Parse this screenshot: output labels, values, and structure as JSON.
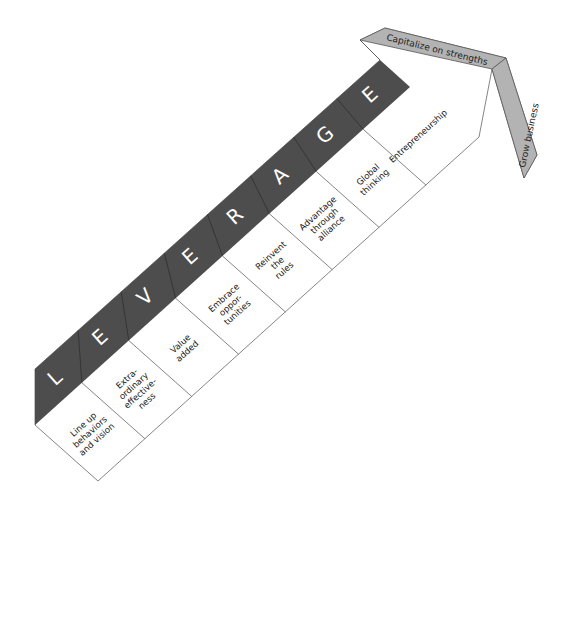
{
  "diagram": {
    "title_letters": [
      "L",
      "E",
      "V",
      "E",
      "R",
      "A",
      "G",
      "E"
    ],
    "cells": [
      {
        "lines": [
          "Line up",
          "behaviors",
          "and vision"
        ]
      },
      {
        "lines": [
          "Extra-",
          "ordinary",
          "effective-",
          "ness"
        ]
      },
      {
        "lines": [
          "Value",
          "added"
        ]
      },
      {
        "lines": [
          "Embrace",
          "oppor-",
          "tunities"
        ]
      },
      {
        "lines": [
          "Reinvent",
          "the",
          "rules"
        ]
      },
      {
        "lines": [
          "Advantage",
          "through",
          "alliance"
        ]
      },
      {
        "lines": [
          "Global",
          "thinking"
        ]
      },
      {
        "lines": [
          "Entrepreneurship"
        ]
      }
    ],
    "arrowhead": {
      "top_label": "Capitalize on strengths",
      "side_label": "Grow business"
    },
    "colors": {
      "band": "#4d4d4d",
      "arrowhead_band": "#b3b3b3",
      "outline": "#555555",
      "background": "#ffffff"
    }
  }
}
